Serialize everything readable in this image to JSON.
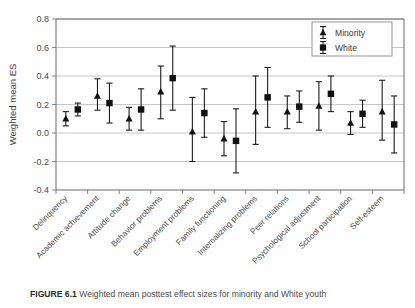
{
  "figure": {
    "caption_label": "FIGURE 6.1",
    "caption_text": "Weighted mean posttest effect sizes for minority and White youth"
  },
  "chart_data": {
    "type": "scatter",
    "title": "",
    "xlabel": "",
    "ylabel": "Weighted mean ES",
    "ylim": [
      -0.4,
      0.8
    ],
    "yticks": [
      -0.4,
      -0.2,
      0.0,
      0.2,
      0.4,
      0.6,
      0.8
    ],
    "ytick_labels": [
      "-0.4",
      "-0.2",
      "0.0",
      "0.2",
      "0.4",
      "0.6",
      "0.8"
    ],
    "grid": "horizontal",
    "legend_position": "top-right",
    "error_bars": "95% confidence interval",
    "categories": [
      "Delinquency",
      "Academic achievement",
      "Attitude change",
      "Behavior problems",
      "Employment problems",
      "Family functioning",
      "Internalizing problems",
      "Peer relations",
      "Psychological adjustment",
      "School participation",
      "Self-esteem"
    ],
    "series": [
      {
        "name": "Minority",
        "marker": "triangle",
        "color": "#111111",
        "values": [
          0.1,
          0.26,
          0.1,
          0.29,
          0.01,
          -0.04,
          0.15,
          0.15,
          0.19,
          0.07,
          0.15
        ],
        "ci_low": [
          0.05,
          0.16,
          0.02,
          0.1,
          -0.2,
          -0.16,
          -0.08,
          0.03,
          0.02,
          -0.01,
          -0.05
        ],
        "ci_high": [
          0.15,
          0.38,
          0.18,
          0.47,
          0.25,
          0.08,
          0.4,
          0.26,
          0.36,
          0.15,
          0.37
        ]
      },
      {
        "name": "White",
        "marker": "square",
        "color": "#111111",
        "values": [
          0.165,
          0.21,
          0.165,
          0.385,
          0.14,
          -0.055,
          0.25,
          0.185,
          0.275,
          0.135,
          0.06
        ],
        "ci_low": [
          0.12,
          0.07,
          0.02,
          0.16,
          -0.03,
          -0.28,
          0.04,
          0.075,
          0.15,
          0.04,
          -0.14
        ],
        "ci_high": [
          0.21,
          0.35,
          0.31,
          0.61,
          0.31,
          0.17,
          0.46,
          0.295,
          0.4,
          0.23,
          0.26
        ]
      }
    ],
    "legend": [
      {
        "label": "Minority",
        "marker": "triangle"
      },
      {
        "label": "White",
        "marker": "square"
      }
    ]
  }
}
